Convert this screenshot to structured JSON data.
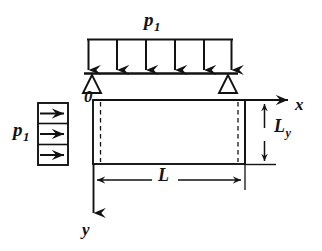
{
  "figure": {
    "background_color": "#ffffff",
    "line_color": "#121212",
    "labels": {
      "load_top": {
        "symbol": "p",
        "subscript": "1"
      },
      "load_left": {
        "symbol": "p",
        "subscript": "1"
      },
      "origin": "0",
      "axis_x": "x",
      "axis_y": "y",
      "dimension_length": "L",
      "dimension_height": {
        "symbol": "L",
        "subscript": "y"
      }
    },
    "top_load": {
      "name": "distributed-load-top",
      "arrow_count": 6,
      "direction": "down",
      "bar_x_start": 87,
      "bar_x_end": 233,
      "bar_y_top": 39,
      "bar_y_bottom": 74
    },
    "left_load": {
      "name": "distributed-load-left",
      "arrow_count": 3,
      "direction": "right",
      "box_x_start": 38,
      "box_x_end": 68,
      "box_y_top": 103,
      "box_y_bottom": 165
    },
    "supports": {
      "name": "pin-support",
      "count": 2,
      "type": "triangle",
      "filled": false,
      "positions_x": [
        92,
        228
      ]
    },
    "plate": {
      "name": "plate-body",
      "x_left": 93,
      "x_right": 245,
      "y_top": 100,
      "y_bottom": 164,
      "dashed_inset_left": 100,
      "dashed_inset_right": 238
    },
    "axes": {
      "x_axis": {
        "from_x": 93,
        "to_x": 290,
        "y": 100,
        "arrow": "right"
      },
      "y_axis": {
        "x": 93,
        "from_y": 164,
        "to_y": 215,
        "arrow": "down"
      }
    }
  }
}
